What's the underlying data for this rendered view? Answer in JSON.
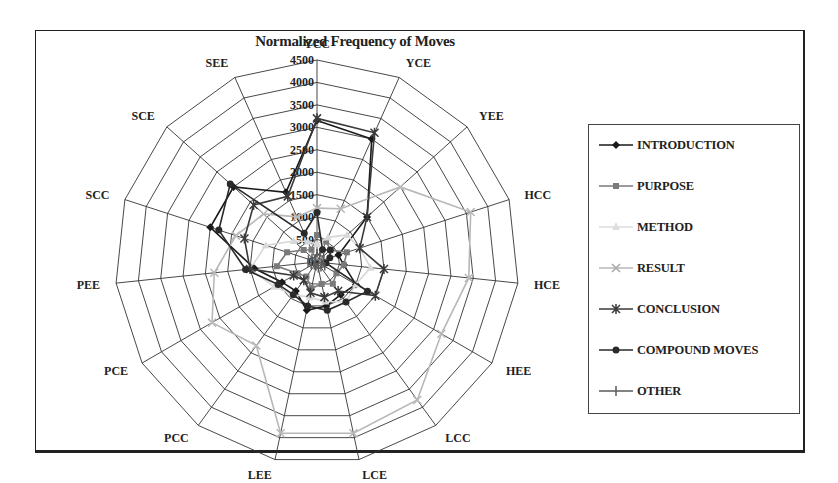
{
  "chart_data": {
    "type": "radar",
    "title": "Normalized Frequency of Moves",
    "categories": [
      "YCC",
      "YCE",
      "YEE",
      "HCC",
      "HCE",
      "HEE",
      "LCC",
      "LCE",
      "LEE",
      "PCC",
      "PCE",
      "PEE",
      "SCC",
      "SCE",
      "SEE"
    ],
    "radial_ticks": [
      "0",
      "500",
      "1000",
      "1500",
      "2000",
      "2500",
      "3000",
      "3500",
      "4000",
      "4500"
    ],
    "rlim": [
      0,
      4500
    ],
    "grid": true,
    "legend_position": "right",
    "series": [
      {
        "name": "INTRODUCTION",
        "marker": "diamond",
        "color": "#1a1a1a",
        "values": [
          3150,
          3000,
          1500,
          500,
          600,
          1000,
          900,
          1000,
          1100,
          800,
          900,
          1400,
          2500,
          2500,
          1700
        ]
      },
      {
        "name": "PURPOSE",
        "marker": "square",
        "color": "#7a7a7a",
        "values": [
          600,
          500,
          400,
          700,
          600,
          500,
          600,
          500,
          600,
          400,
          500,
          900,
          700,
          400,
          300
        ]
      },
      {
        "name": "METHOD",
        "marker": "triangle",
        "color": "#d8d8d8",
        "values": [
          400,
          600,
          900,
          1000,
          1200,
          1000,
          1100,
          900,
          800,
          900,
          1100,
          1500,
          1200,
          700,
          500
        ]
      },
      {
        "name": "RESULT",
        "marker": "x",
        "color": "#b8b8b8",
        "values": [
          1200,
          1300,
          2500,
          3600,
          3400,
          3200,
          3800,
          3900,
          3900,
          2300,
          2700,
          2300,
          1900,
          1600,
          1100
        ]
      },
      {
        "name": "CONCLUSION",
        "marker": "asterisk",
        "color": "#3a3a3a",
        "values": [
          3200,
          3150,
          1500,
          1000,
          1500,
          1500,
          800,
          800,
          700,
          500,
          600,
          1500,
          1700,
          1900,
          1600
        ]
      },
      {
        "name": "COMPOUND MOVES",
        "marker": "circle",
        "color": "#2a2a2a",
        "values": [
          1100,
          300,
          400,
          300,
          200,
          1300,
          1100,
          1100,
          1000,
          900,
          1000,
          1600,
          2300,
          2600,
          700
        ]
      },
      {
        "name": "OTHER",
        "marker": "plus",
        "color": "#5a5a5a",
        "values": [
          200,
          150,
          200,
          150,
          100,
          200,
          150,
          150,
          100,
          100,
          150,
          200,
          200,
          150,
          100
        ]
      }
    ]
  },
  "legend": {
    "items": [
      {
        "label": "INTRODUCTION"
      },
      {
        "label": "PURPOSE"
      },
      {
        "label": "METHOD"
      },
      {
        "label": "RESULT"
      },
      {
        "label": "CONCLUSION"
      },
      {
        "label": "COMPOUND MOVES"
      },
      {
        "label": "OTHER"
      }
    ]
  }
}
